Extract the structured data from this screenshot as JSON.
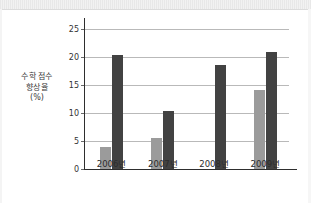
{
  "chart_data": {
    "type": "bar",
    "title": "",
    "subtitle": "",
    "xlabel": "",
    "ylabel": "수학 점수 향상율 (%)",
    "ylabel_lines": [
      "수학 점수",
      "향상율",
      "(%)"
    ],
    "categories": [
      "2006년",
      "2007년",
      "2008년",
      "2009년"
    ],
    "series": [
      {
        "name": "light-gray-series",
        "color": "#9b9b9b",
        "values": [
          4.0,
          5.5,
          0,
          14.2
        ]
      },
      {
        "name": "dark-gray-series",
        "color": "#424242",
        "values": [
          20.4,
          10.3,
          18.6,
          21.0
        ]
      }
    ],
    "yticks": [
      0,
      5,
      10,
      15,
      20,
      25
    ],
    "ytick_labels": [
      "0",
      "5",
      "10",
      "15",
      "20",
      "25"
    ],
    "ylim": [
      0,
      27
    ],
    "grid": true,
    "legend": "none",
    "axis_color": "#2e2e2e",
    "grid_color": "#b9b9b9",
    "background": "#ffffff"
  }
}
